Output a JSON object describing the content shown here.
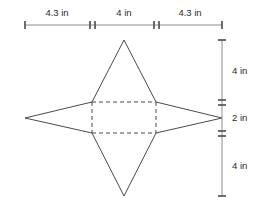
{
  "figure": {
    "colors": {
      "background": "#ffffff",
      "edge": "#4a4a4a",
      "fold": "#4a4a4a",
      "dimension_line": "#8c8c8c",
      "label_text": "#2b2b2b"
    },
    "horizontal_dimensions": [
      {
        "label": "4.3 in",
        "value": 4.3,
        "unit": "in",
        "segment": "left-slant"
      },
      {
        "label": "4 in",
        "value": 4,
        "unit": "in",
        "segment": "center-square"
      },
      {
        "label": "4.3 in",
        "value": 4.3,
        "unit": "in",
        "segment": "right-slant"
      }
    ],
    "vertical_dimensions": [
      {
        "label": "4 in",
        "value": 4,
        "unit": "in",
        "segment": "top-triangle"
      },
      {
        "label": "2 in",
        "value": 2,
        "unit": "in",
        "segment": "center-square"
      },
      {
        "label": "4 in",
        "value": 4,
        "unit": "in",
        "segment": "bottom-triangle"
      }
    ],
    "geometry": {
      "square": {
        "left": 92,
        "top": 102,
        "right": 156,
        "bottom": 133
      },
      "apexes": {
        "top": {
          "x": 124,
          "y": 40
        },
        "bottom": {
          "x": 124,
          "y": 196
        },
        "left": {
          "x": 25,
          "y": 118
        },
        "right": {
          "x": 222,
          "y": 118
        }
      },
      "horizontal_dim_line": {
        "y": 25,
        "x_start": 25,
        "x_end": 222,
        "ticks": [
          25,
          92,
          156,
          222
        ]
      },
      "vertical_dim_line": {
        "x": 222,
        "y_start": 40,
        "y_end": 196,
        "ticks": [
          40,
          102,
          133,
          196
        ]
      }
    }
  }
}
